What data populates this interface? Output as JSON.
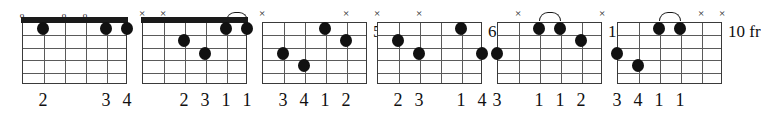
{
  "diagram": {
    "type": "guitar-chord-chart",
    "string_count": 6,
    "fret_count": 5,
    "markers": {
      "open": "o",
      "muted": "×"
    },
    "chords": [
      {
        "index": 1,
        "position_label": "",
        "show_nut": true,
        "top_markers": [
          {
            "string": 1,
            "kind": "open",
            "glyph": "o"
          },
          {
            "string": 3,
            "kind": "open",
            "glyph": "o"
          },
          {
            "string": 4,
            "kind": "open",
            "glyph": "o"
          }
        ],
        "arcs": [],
        "dots": [
          {
            "string": 2,
            "fret": 1
          },
          {
            "string": 5,
            "fret": 1
          },
          {
            "string": 6,
            "fret": 1
          }
        ],
        "fingering": [
          {
            "string": 2,
            "label": "2"
          },
          {
            "string": 5,
            "label": "3"
          },
          {
            "string": 6,
            "label": "4"
          }
        ]
      },
      {
        "index": 2,
        "position_label": "",
        "show_nut": true,
        "top_markers": [
          {
            "string": 1,
            "kind": "muted",
            "glyph": "×"
          },
          {
            "string": 2,
            "kind": "muted",
            "glyph": "×"
          }
        ],
        "arcs": [
          {
            "from_string": 5,
            "to_string": 6
          }
        ],
        "dots": [
          {
            "string": 3,
            "fret": 2
          },
          {
            "string": 4,
            "fret": 3
          },
          {
            "string": 5,
            "fret": 1
          },
          {
            "string": 6,
            "fret": 1
          }
        ],
        "fingering": [
          {
            "string": 3,
            "label": "2"
          },
          {
            "string": 4,
            "label": "3"
          },
          {
            "string": 5,
            "label": "1"
          },
          {
            "string": 6,
            "label": "1"
          }
        ]
      },
      {
        "index": 3,
        "position_label": "5 fr",
        "show_nut": false,
        "top_markers": [
          {
            "string": 1,
            "kind": "muted",
            "glyph": "×"
          },
          {
            "string": 5,
            "kind": "muted",
            "glyph": "×"
          }
        ],
        "arcs": [],
        "dots": [
          {
            "string": 2,
            "fret": 3
          },
          {
            "string": 3,
            "fret": 4
          },
          {
            "string": 4,
            "fret": 1
          },
          {
            "string": 5,
            "fret": 2
          }
        ],
        "fingering": [
          {
            "string": 2,
            "label": "3"
          },
          {
            "string": 3,
            "label": "4"
          },
          {
            "string": 4,
            "label": "1"
          },
          {
            "string": 5,
            "label": "2"
          }
        ]
      },
      {
        "index": 4,
        "position_label": "6 fr",
        "show_nut": false,
        "top_markers": [
          {
            "string": 1,
            "kind": "muted",
            "glyph": "×"
          },
          {
            "string": 3,
            "kind": "muted",
            "glyph": "×"
          }
        ],
        "arcs": [],
        "dots": [
          {
            "string": 2,
            "fret": 2
          },
          {
            "string": 3,
            "fret": 3
          },
          {
            "string": 5,
            "fret": 1
          },
          {
            "string": 6,
            "fret": 3
          }
        ],
        "fingering": [
          {
            "string": 2,
            "label": "2"
          },
          {
            "string": 3,
            "label": "3"
          },
          {
            "string": 5,
            "label": "1"
          },
          {
            "string": 6,
            "label": "4"
          }
        ]
      },
      {
        "index": 5,
        "position_label": "10 fr",
        "show_nut": false,
        "top_markers": [
          {
            "string": 2,
            "kind": "muted",
            "glyph": "×"
          },
          {
            "string": 6,
            "kind": "muted",
            "glyph": "×"
          }
        ],
        "arcs": [
          {
            "from_string": 3,
            "to_string": 4
          }
        ],
        "dots": [
          {
            "string": 1,
            "fret": 3
          },
          {
            "string": 3,
            "fret": 1
          },
          {
            "string": 4,
            "fret": 1
          },
          {
            "string": 5,
            "fret": 2
          }
        ],
        "fingering": [
          {
            "string": 1,
            "label": "3"
          },
          {
            "string": 3,
            "label": "1"
          },
          {
            "string": 4,
            "label": "1"
          },
          {
            "string": 5,
            "label": "2"
          }
        ]
      },
      {
        "index": 6,
        "position_label": "10 fr",
        "show_nut": false,
        "top_markers": [
          {
            "string": 5,
            "kind": "muted",
            "glyph": "×"
          },
          {
            "string": 6,
            "kind": "muted",
            "glyph": "×"
          }
        ],
        "arcs": [
          {
            "from_string": 3,
            "to_string": 4
          }
        ],
        "dots": [
          {
            "string": 1,
            "fret": 3
          },
          {
            "string": 2,
            "fret": 4
          },
          {
            "string": 3,
            "fret": 1
          },
          {
            "string": 4,
            "fret": 1
          }
        ],
        "fingering": [
          {
            "string": 1,
            "label": "3"
          },
          {
            "string": 2,
            "label": "4"
          },
          {
            "string": 3,
            "label": "1"
          },
          {
            "string": 4,
            "label": "1"
          }
        ]
      }
    ],
    "layout": {
      "origins_x": [
        22,
        142,
        262,
        377,
        497,
        617
      ],
      "grid_top": 22,
      "string_spacing": 21,
      "fret_spacing": 12.4,
      "colors": {
        "ink": "#111111",
        "grid": "#5a5a5a",
        "nut": "#1a1a1a",
        "background": "#ffffff"
      }
    }
  }
}
